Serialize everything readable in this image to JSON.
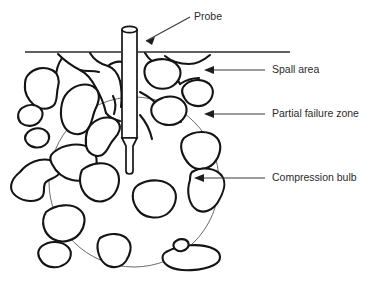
{
  "figure": {
    "background_color": "#ffffff",
    "line_color": "#141414",
    "label_color": "#2b2b2b",
    "bulb_color": "#5a5a5a"
  },
  "labels": {
    "probe": "Probe",
    "spall_area": "Spall area",
    "partial_failure_zone": "Partial failure zone",
    "compression_bulb": "Compression bulb"
  },
  "elements": {
    "ground_line_name": "ground-surface-line",
    "probe_name": "probe-shaft",
    "bulb_name": "compression-bulb-circle",
    "rocks_name": "aggregate-particles",
    "cracks_name": "crack-network"
  }
}
